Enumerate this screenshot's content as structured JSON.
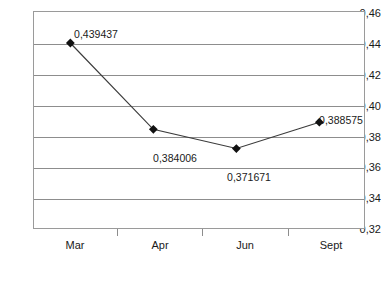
{
  "chart_data": {
    "type": "line",
    "title": "",
    "xlabel": "",
    "ylabel": "",
    "categories": [
      "Mar",
      "Apr",
      "Jun",
      "Sept"
    ],
    "values": [
      0.439437,
      0.384006,
      0.371671,
      0.388575
    ],
    "point_labels": [
      "0,439437",
      "0,384006",
      "0,371671",
      "0,388575"
    ],
    "ylim": [
      0.32,
      0.46
    ],
    "ytick_step": 0.02,
    "ytick_labels": [
      "0,46",
      "0,44",
      "0,42",
      "0,40",
      "0,38",
      "0,36",
      "0,34",
      "0,32"
    ],
    "ytick_values": [
      0.46,
      0.44,
      0.42,
      0.4,
      0.38,
      0.36,
      0.34,
      0.32
    ],
    "grid": true,
    "legend": false,
    "decimal_separator": ",",
    "series": [
      {
        "name": "",
        "values": [
          0.439437,
          0.384006,
          0.371671,
          0.388575
        ],
        "line_color": "#3b3b3b",
        "marker": "diamond",
        "marker_color": "#111111"
      }
    ],
    "colors": {
      "line": "#3b3b3b",
      "marker": "#111111",
      "grid": "#8d8d8d",
      "frame": "#9a9a9a",
      "text": "#1a1a1a",
      "background": "#ffffff"
    }
  }
}
